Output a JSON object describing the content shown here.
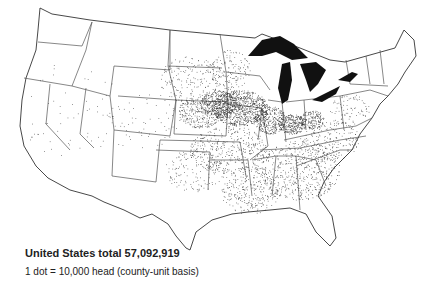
{
  "map": {
    "title": "Hog dot-density map of the United States",
    "total_label": "United States total 57,092,919",
    "legend_label": "1 dot = 10,000 head (county-unit basis)",
    "dot_value": 10000,
    "total": 57092919,
    "colors": {
      "dot": "#333333",
      "lake": "#111111",
      "border": "#555555",
      "background": "#ffffff"
    },
    "dense_regions": [
      "Iowa",
      "southern Minnesota",
      "Illinois",
      "Indiana",
      "Ohio",
      "Nebraska (east)"
    ]
  }
}
